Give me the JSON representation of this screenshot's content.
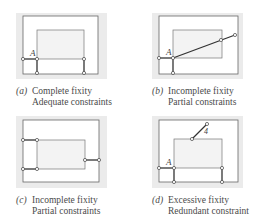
{
  "figure": {
    "panels": [
      {
        "id": "a",
        "tag": "(a)",
        "title": "Complete fixity",
        "subtitle": "Adequate constraints",
        "point_label": "A"
      },
      {
        "id": "b",
        "tag": "(b)",
        "title": "Incomplete fixity",
        "subtitle": "Partial constraints",
        "point_label": "A"
      },
      {
        "id": "c",
        "tag": "(c)",
        "title": "Incomplete fixity",
        "subtitle": "Partial constraints"
      },
      {
        "id": "d",
        "tag": "(d)",
        "title": "Excessive fixity",
        "subtitle": "Redundant constraint",
        "point_label": "A",
        "link_label": "4"
      }
    ],
    "colors": {
      "background_shade": "#ebebeb",
      "frame_stroke": "#555555",
      "inner_rect_fill": "#f3f3f3",
      "link_stroke": "#333333",
      "text": "#4a4a4a"
    }
  }
}
